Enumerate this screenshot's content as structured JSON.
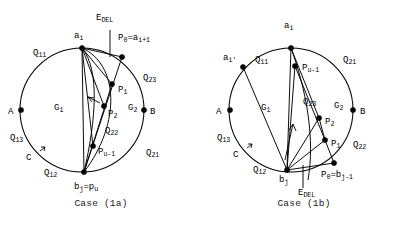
{
  "figure": {
    "panels": [
      {
        "id": "case-1a",
        "caption": "Case (1a)",
        "vertex_labels": {
          "a_i": {
            "base": "a",
            "sub": "i"
          },
          "p0": {
            "base": "P",
            "sub": "0",
            "tail": "=a",
            "tail_sub": "i+1"
          },
          "p1": {
            "base": "P",
            "sub": "1"
          },
          "p2": {
            "base": "P",
            "sub": "2"
          },
          "pu_1": {
            "base": "P",
            "sub": "u-1"
          },
          "bj": {
            "base": "b",
            "sub": "j",
            "tail": "=p",
            "tail_sub": "u"
          },
          "A": {
            "base": "A",
            "sub": ""
          },
          "B": {
            "base": "B",
            "sub": ""
          },
          "C": {
            "base": "C",
            "sub": ""
          },
          "edel": {
            "base": "E",
            "sub": "DEL"
          },
          "g1": {
            "base": "G",
            "sub": "1"
          },
          "g2": {
            "base": "G",
            "sub": "2"
          },
          "q11": {
            "base": "Q",
            "sub": "11"
          },
          "q12": {
            "base": "Q",
            "sub": "12"
          },
          "q13": {
            "base": "Q",
            "sub": "13"
          },
          "q21": {
            "base": "Q",
            "sub": "21"
          },
          "q22": {
            "base": "Q",
            "sub": "22"
          },
          "q23": {
            "base": "Q",
            "sub": "23"
          }
        }
      },
      {
        "id": "case-1b",
        "caption": "Case (1b)",
        "vertex_labels": {
          "a_i": {
            "base": "a",
            "sub": "i"
          },
          "a_i_prime": {
            "base": "a",
            "sub": "i'"
          },
          "p0": {
            "base": "P",
            "sub": "0",
            "tail": "=b",
            "tail_sub": "j-1"
          },
          "p1": {
            "base": "P",
            "sub": "1"
          },
          "p2": {
            "base": "P",
            "sub": "2"
          },
          "pu_1": {
            "base": "P",
            "sub": "u-1"
          },
          "bj": {
            "base": "b",
            "sub": "j"
          },
          "A": {
            "base": "A",
            "sub": ""
          },
          "B": {
            "base": "B",
            "sub": ""
          },
          "C": {
            "base": "C",
            "sub": ""
          },
          "edel": {
            "base": "E",
            "sub": "DEL"
          },
          "g1": {
            "base": "G",
            "sub": "1"
          },
          "g2": {
            "base": "G",
            "sub": "2"
          },
          "q11": {
            "base": "Q",
            "sub": "11"
          },
          "q12": {
            "base": "Q",
            "sub": "12"
          },
          "q13": {
            "base": "Q",
            "sub": "13"
          },
          "q21": {
            "base": "Q",
            "sub": "21"
          },
          "q22": {
            "base": "Q",
            "sub": "22"
          },
          "q23": {
            "base": "Q",
            "sub": "23"
          }
        }
      }
    ],
    "colors": {
      "stroke": "#000000",
      "background": "#ffffff",
      "text": "#000000"
    }
  }
}
